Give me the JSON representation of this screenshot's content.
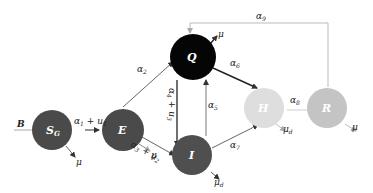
{
  "diagram": {
    "title": "",
    "nodes": [
      {
        "id": "SG",
        "label": "S",
        "sub": "G",
        "color": "#4a4a4a",
        "cx": 62,
        "cy": 130,
        "r": 23
      },
      {
        "id": "E",
        "label": "E",
        "sub": "",
        "color": "#4a4a4a",
        "cx": 123,
        "cy": 130,
        "r": 23
      },
      {
        "id": "Q",
        "label": "Q",
        "sub": "",
        "color": "#050505",
        "cx": 197,
        "cy": 57,
        "r": 23
      },
      {
        "id": "I",
        "label": "I",
        "sub": "",
        "color": "#4f4f4f",
        "cx": 197,
        "cy": 157,
        "r": 23
      },
      {
        "id": "H",
        "label": "H",
        "sub": "",
        "color": "#dedede",
        "cx": 264,
        "cy": 110,
        "r": 23
      },
      {
        "id": "R",
        "label": "R",
        "sub": "",
        "color": "#c4c4c4",
        "cx": 333,
        "cy": 110,
        "r": 23
      }
    ],
    "edges": [
      {
        "from": "B",
        "to": "SG",
        "label": "B"
      },
      {
        "from": "SG",
        "to": "E",
        "label": "α₁ + u₁"
      },
      {
        "from": "E",
        "to": "Q",
        "label": "α₂"
      },
      {
        "from": "E",
        "to": "I",
        "label": "α₃ + u₂"
      },
      {
        "from": "Q",
        "to": "I",
        "label": "α₄ + u₃"
      },
      {
        "from": "I",
        "to": "Q",
        "label": "α₅"
      },
      {
        "from": "Q",
        "to": "H",
        "label": "α₆"
      },
      {
        "from": "I",
        "to": "H",
        "label": "α₇"
      },
      {
        "from": "H",
        "to": "R",
        "label": "α₈"
      },
      {
        "from": "R",
        "to": "Q",
        "label": "α₉"
      }
    ],
    "outflows": [
      {
        "node": "SG",
        "label": "μ"
      },
      {
        "node": "E",
        "label": "μ"
      },
      {
        "node": "Q",
        "label": "μ"
      },
      {
        "node": "I",
        "label": "μ_d"
      },
      {
        "node": "H",
        "label": "μ_d"
      },
      {
        "node": "R",
        "label": "μ"
      }
    ]
  },
  "labels": {
    "B": "B",
    "SG_main": "S",
    "SG_sub": "G",
    "E": "E",
    "Q": "Q",
    "I": "I",
    "H": "H",
    "R": "R",
    "a1u1": "α",
    "a1u1_sub": "1",
    "a1u1_plus": " + u",
    "a1u1_sub2": "1",
    "a2": "α",
    "a2_sub": "2",
    "a3": "α",
    "a3_sub": "3",
    "a3_plus": " + u",
    "a3_sub2": "2",
    "a4": "α",
    "a4_sub": "4",
    "a4_plus": " + u",
    "a4_sub2": "3",
    "a5": "α",
    "a5_sub": "5",
    "a6": "α",
    "a6_sub": "6",
    "a7": "α",
    "a7_sub": "7",
    "a8": "α",
    "a8_sub": "8",
    "a9": "α",
    "a9_sub": "9",
    "mu": "μ",
    "mu_d": "μ",
    "d": "d"
  },
  "colors": {
    "dark_node": "#4a4a4a",
    "black_node": "#050505",
    "light_node": "#dedede",
    "mid_node": "#c4c4c4",
    "edge_dark": "#333333",
    "edge_light": "#b8b8b8"
  }
}
